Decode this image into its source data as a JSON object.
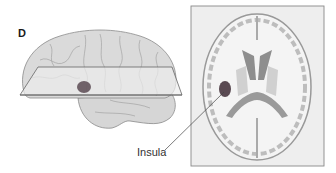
{
  "figure": {
    "panel_label": "D",
    "callout_label": "Insula",
    "left_view": "lateral view of brain with horizontal cutting plane and highlighted insula",
    "right_view": "horizontal (axial) section of brain showing insula highlighted",
    "colors": {
      "brain_fill": "#d9d9d9",
      "brain_outline": "#8a8a8a",
      "plane_fill": "#eaeaea",
      "plane_edge": "#666666",
      "insula_highlight": "#5a4a52",
      "section_box_bg": "#eeeeee",
      "gray_matter": "#bfbfbf",
      "ventricle": "#8e8e8e"
    }
  }
}
